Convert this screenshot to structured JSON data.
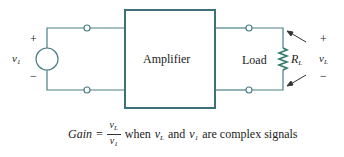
{
  "diagram": {
    "block_label": "Amplifier",
    "load_label": "Load",
    "source": {
      "symbol": "v",
      "subscript": "1",
      "plus": "+",
      "minus": "−"
    },
    "output": {
      "symbol": "v",
      "subscript": "L",
      "plus": "+",
      "minus": "−"
    },
    "resistor": {
      "symbol": "R",
      "subscript": "L"
    },
    "colors": {
      "wire": "#4a7f86",
      "box": "#3d7078",
      "resistor": "#2f7a6c",
      "text": "#222222"
    }
  },
  "formula": {
    "lhs": "Gain",
    "equals": "=",
    "numerator": {
      "symbol": "v",
      "subscript": "L"
    },
    "denominator": {
      "symbol": "v",
      "subscript": "1"
    },
    "when": "when",
    "var1": {
      "symbol": "v",
      "subscript": "L"
    },
    "and": "and",
    "var2": {
      "symbol": "v",
      "subscript": "1"
    },
    "tail": "are complex signals"
  }
}
